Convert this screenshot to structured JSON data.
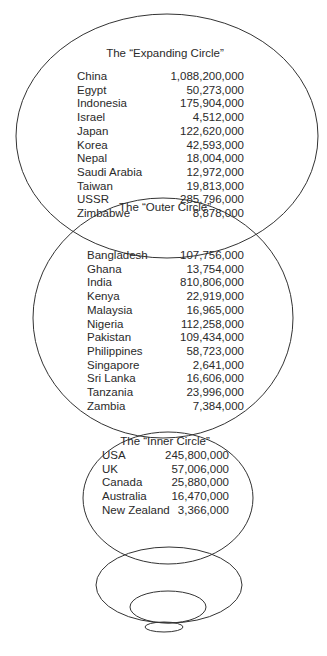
{
  "diagram": {
    "type": "concentric-circles-stack",
    "circles": [
      {
        "title": "The “Expanding Circle”",
        "rows": [
          {
            "country": "China",
            "population": "1,088,200,000"
          },
          {
            "country": "Egypt",
            "population": "50,273,000"
          },
          {
            "country": "Indonesia",
            "population": "175,904,000"
          },
          {
            "country": "Israel",
            "population": "4,512,000"
          },
          {
            "country": "Japan",
            "population": "122,620,000"
          },
          {
            "country": "Korea",
            "population": "42,593,000"
          },
          {
            "country": "Nepal",
            "population": "18,004,000"
          },
          {
            "country": "Saudi Arabia",
            "population": "12,972,000"
          },
          {
            "country": "Taiwan",
            "population": "19,813,000"
          },
          {
            "country": "USSR",
            "population": "285,796,000"
          },
          {
            "country": "Zimbabwe",
            "population": "8,878,000"
          }
        ]
      },
      {
        "title": "The “Outer Circle”",
        "rows": [
          {
            "country": "Bangladesh",
            "population": "107,756,000"
          },
          {
            "country": "Ghana",
            "population": "13,754,000"
          },
          {
            "country": "India",
            "population": "810,806,000"
          },
          {
            "country": "Kenya",
            "population": "22,919,000"
          },
          {
            "country": "Malaysia",
            "population": "16,965,000"
          },
          {
            "country": "Nigeria",
            "population": "112,258,000"
          },
          {
            "country": "Pakistan",
            "population": "109,434,000"
          },
          {
            "country": "Philippines",
            "population": "58,723,000"
          },
          {
            "country": "Singapore",
            "population": "2,641,000"
          },
          {
            "country": "Sri Lanka",
            "population": "16,606,000"
          },
          {
            "country": "Tanzania",
            "population": "23,996,000"
          },
          {
            "country": "Zambia",
            "population": "7,384,000"
          }
        ]
      },
      {
        "title": "The “Inner Circle”",
        "rows": [
          {
            "country": "USA",
            "population": "245,800,000"
          },
          {
            "country": "UK",
            "population": "57,006,000"
          },
          {
            "country": "Canada",
            "population": "25,880,000"
          },
          {
            "country": "Australia",
            "population": "16,470,000"
          },
          {
            "country": "New Zealand",
            "population": "3,366,000"
          }
        ]
      }
    ],
    "line_color": "#333333"
  }
}
